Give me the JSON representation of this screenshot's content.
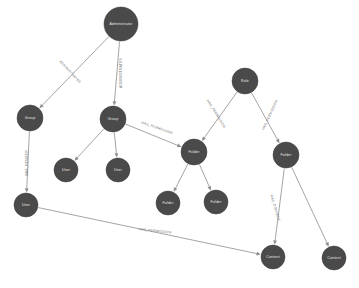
{
  "diagram": {
    "background_color": "#ffffff",
    "node_color": "#4a4a4a",
    "node_text_color": "#e8e8e8",
    "edge_color": "#9a9a9a",
    "edge_label_color": "#6e6e6e",
    "type": "directed-graph",
    "nodes": [
      {
        "id": "administrator",
        "label": "Administrator",
        "x": 121,
        "y": 24,
        "r": 17
      },
      {
        "id": "group_left",
        "label": "Group",
        "x": 30,
        "y": 118,
        "r": 13
      },
      {
        "id": "group_mid",
        "label": "Group",
        "x": 113,
        "y": 119,
        "r": 13
      },
      {
        "id": "user_a",
        "label": "User",
        "x": 66,
        "y": 170,
        "r": 12
      },
      {
        "id": "user_b",
        "label": "User",
        "x": 118,
        "y": 170,
        "r": 12
      },
      {
        "id": "user_left",
        "label": "User",
        "x": 26,
        "y": 205,
        "r": 12
      },
      {
        "id": "role",
        "label": "Role",
        "x": 245,
        "y": 81,
        "r": 13
      },
      {
        "id": "folder_mid",
        "label": "Folder",
        "x": 194,
        "y": 152,
        "r": 13
      },
      {
        "id": "folder_right",
        "label": "Folder",
        "x": 286,
        "y": 155,
        "r": 13
      },
      {
        "id": "folder_c",
        "label": "Folder",
        "x": 168,
        "y": 203,
        "r": 12
      },
      {
        "id": "folder_d",
        "label": "Folder",
        "x": 216,
        "y": 202,
        "r": 12
      },
      {
        "id": "content",
        "label": "Content",
        "x": 273,
        "y": 257,
        "r": 12
      },
      {
        "id": "content_2",
        "label": "Content",
        "x": 334,
        "y": 258,
        "r": 12
      }
    ],
    "edges": [
      {
        "from": "administrator",
        "to": "group_left",
        "label": "ADMINISTRATES",
        "label_x": 70,
        "label_y": 72,
        "label_rotate": 47
      },
      {
        "from": "administrator",
        "to": "group_mid",
        "label": "ADMINISTRATES",
        "label_x": 121,
        "label_y": 73,
        "label_rotate": -90
      },
      {
        "from": "group_left",
        "to": "user_left",
        "label": "HAS_MEMBER",
        "label_x": 27,
        "label_y": 163,
        "label_rotate": -90
      },
      {
        "from": "group_mid",
        "to": "user_a",
        "label": "",
        "label_x": 0,
        "label_y": 0,
        "label_rotate": 0
      },
      {
        "from": "group_mid",
        "to": "user_b",
        "label": "",
        "label_x": 0,
        "label_y": 0,
        "label_rotate": 0
      },
      {
        "from": "group_mid",
        "to": "folder_mid",
        "label": "HAS_PERMISSION",
        "label_x": 157,
        "label_y": 128,
        "label_rotate": 19
      },
      {
        "from": "role",
        "to": "folder_mid",
        "label": "HAS_PERMISSION",
        "label_x": 216,
        "label_y": 114,
        "label_rotate": 58
      },
      {
        "from": "role",
        "to": "folder_right",
        "label": "HAS_PERMISSION",
        "label_x": 270,
        "label_y": 115,
        "label_rotate": -65
      },
      {
        "from": "folder_mid",
        "to": "folder_c",
        "label": "",
        "label_x": 0,
        "label_y": 0,
        "label_rotate": 0
      },
      {
        "from": "folder_mid",
        "to": "folder_d",
        "label": "",
        "label_x": 0,
        "label_y": 0,
        "label_rotate": 0
      },
      {
        "from": "folder_right",
        "to": "content",
        "label": "HAS_CONTENT",
        "label_x": 275,
        "label_y": 208,
        "label_rotate": 73
      },
      {
        "from": "folder_right",
        "to": "content_2",
        "label": "",
        "label_x": 0,
        "label_y": 0,
        "label_rotate": 0
      },
      {
        "from": "user_left",
        "to": "content",
        "label": "HAS_PERMISSION",
        "label_x": 155,
        "label_y": 231,
        "label_rotate": 6
      }
    ]
  }
}
